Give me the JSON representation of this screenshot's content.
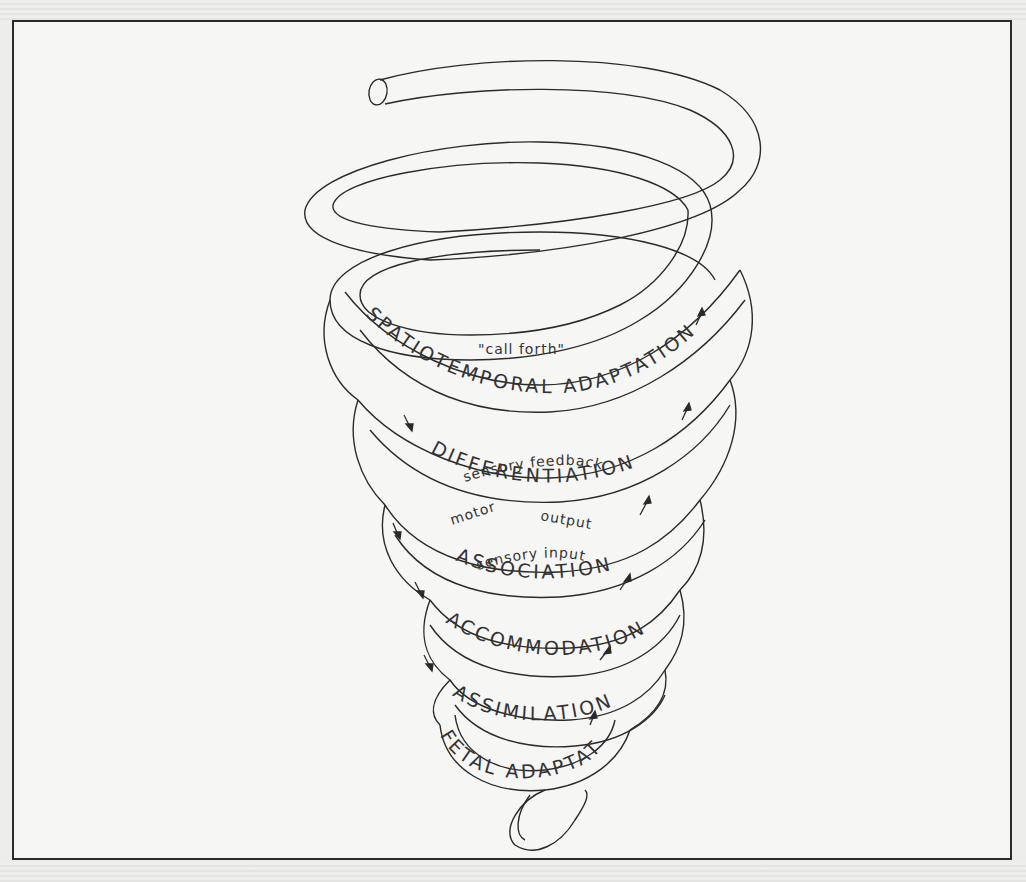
{
  "diagram": {
    "type": "spiral-diagram",
    "stages": [
      {
        "label": "SPATIOTEMPORAL ADAPTATION"
      },
      {
        "label": "DIFFERENTIATION"
      },
      {
        "label": "ASSOCIATION"
      },
      {
        "label": "ACCOMMODATION"
      },
      {
        "label": "ASSIMILATION"
      },
      {
        "label": "FETAL ADAPTATIONS"
      }
    ],
    "processes": [
      {
        "label": "\"call forth\""
      },
      {
        "label": "sensory feedback"
      },
      {
        "label": "motor"
      },
      {
        "label": "output"
      },
      {
        "label": "sensory input"
      }
    ],
    "arrows": {
      "left_side": "downward",
      "right_side": "upward"
    },
    "colors": {
      "ink": "#2a2a2a",
      "paper": "#f6f6f4"
    }
  }
}
